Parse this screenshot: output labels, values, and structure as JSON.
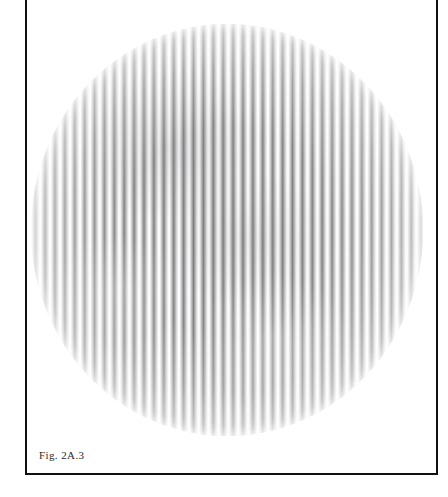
{
  "figure": {
    "caption": "Fig. 2A.3",
    "frame": {
      "border_color": "#111111",
      "background_color": "#ffffff"
    },
    "image_type": "interferogram",
    "aperture_shape": "circle",
    "fringe_orientation": "vertical",
    "fringe_count": 40,
    "fringe_period_px": 9.9,
    "fringe_dark_color": "#6c6c6f",
    "fringe_light_color": "#fbfbfb",
    "contrast_profile": "highest at centre, fading toward rim"
  }
}
